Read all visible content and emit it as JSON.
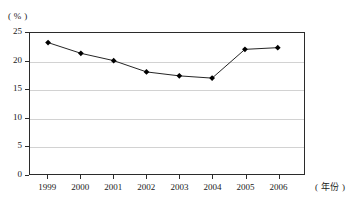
{
  "chart_data": {
    "type": "line",
    "title": "",
    "subtitle": "",
    "xlabel": "( 年份 )",
    "ylabel": "( % )",
    "categories": [
      "1999",
      "2000",
      "2001",
      "2002",
      "2003",
      "2004",
      "2005",
      "2006"
    ],
    "values": [
      23.3,
      21.4,
      20.1,
      18.1,
      17.4,
      17.0,
      22.1,
      22.4
    ],
    "series": [
      {
        "name": "",
        "values": [
          23.3,
          21.4,
          20.1,
          18.1,
          17.4,
          17.0,
          22.1,
          22.4
        ]
      }
    ],
    "ylim": [
      0,
      25
    ],
    "yticks": [
      0,
      5,
      10,
      15,
      20,
      25
    ],
    "ytick_labels": [
      "0",
      "5",
      "10",
      "15",
      "20",
      "25"
    ],
    "grid": true,
    "grid_axis": "y",
    "legend": false,
    "legend_position": "none",
    "marker": "diamond",
    "line_color": "#222222",
    "marker_color": "#000000",
    "grid_color": "#d2d2d2",
    "axis_color": "#2b2b2b",
    "background_color": "#ffffff"
  },
  "axes": {
    "y_unit_label": "( % )",
    "x_unit_label": "( 年份 )"
  }
}
